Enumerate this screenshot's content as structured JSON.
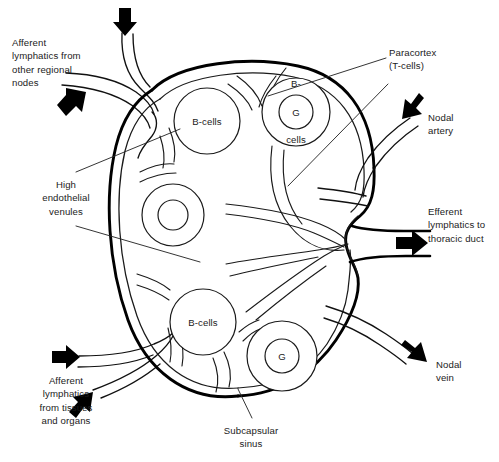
{
  "figure": {
    "background_color": "#ffffff",
    "ink_color": "#1a1a1a",
    "width": 499,
    "height": 462
  },
  "labels": {
    "afferent_regional": {
      "text": "Afferent\nlymphatics from\nother regional\nnodes",
      "x": 12,
      "y": 36
    },
    "high_endothelial_venules": {
      "text": "High\nendothelial\nvenules",
      "x": 30,
      "y": 178
    },
    "afferent_tissues": {
      "text": "Afferent\nlymphatics\nfrom tissues\nand organs",
      "x": 22,
      "y": 374
    },
    "paracortex": {
      "text": "Paracortex\n(T-cells)",
      "x": 389,
      "y": 46
    },
    "nodal_artery": {
      "text": "Nodal\nartery",
      "x": 428,
      "y": 111
    },
    "efferent_lymphatics": {
      "text": "Efferent\nlymphatics to\nthoracic duct",
      "x": 428,
      "y": 205
    },
    "nodal_vein": {
      "text": "Nodal\nvein",
      "x": 436,
      "y": 358
    },
    "subcapsular_sinus": {
      "text": "Subcapsular\nsinus",
      "x": 213,
      "y": 424
    }
  },
  "follicles": [
    {
      "id": "follicle-upper-left",
      "label": "B-cells",
      "cx": 207,
      "cy": 121,
      "r": 33,
      "germinal_r": 0,
      "germinal_label": ""
    },
    {
      "id": "follicle-upper-right",
      "label": "",
      "cx": 296,
      "cy": 112,
      "r": 34,
      "germinal_r": 17,
      "germinal_label": "G"
    },
    {
      "id": "follicle-middle-left",
      "label": "",
      "cx": 173,
      "cy": 215,
      "r": 31,
      "germinal_r": 15,
      "germinal_label": ""
    },
    {
      "id": "follicle-lower-left",
      "label": "B-cells",
      "cx": 203,
      "cy": 322,
      "r": 33,
      "germinal_r": 0,
      "germinal_label": ""
    },
    {
      "id": "follicle-lower-right",
      "label": "",
      "cx": 282,
      "cy": 356,
      "r": 35,
      "germinal_r": 17,
      "germinal_label": "G"
    }
  ],
  "follicle_text": {
    "upper_right_top": "B-",
    "upper_right_bottom": "cells"
  },
  "arrows": [
    {
      "id": "arrow-afferent-top",
      "direction": "down"
    },
    {
      "id": "arrow-afferent-upper-left",
      "direction": "up-right"
    },
    {
      "id": "arrow-afferent-lower-left-1",
      "direction": "right"
    },
    {
      "id": "arrow-afferent-lower-left-2",
      "direction": "up-right"
    },
    {
      "id": "arrow-nodal-artery",
      "direction": "down-left"
    },
    {
      "id": "arrow-efferent",
      "direction": "right"
    },
    {
      "id": "arrow-nodal-vein",
      "direction": "down-right"
    }
  ]
}
